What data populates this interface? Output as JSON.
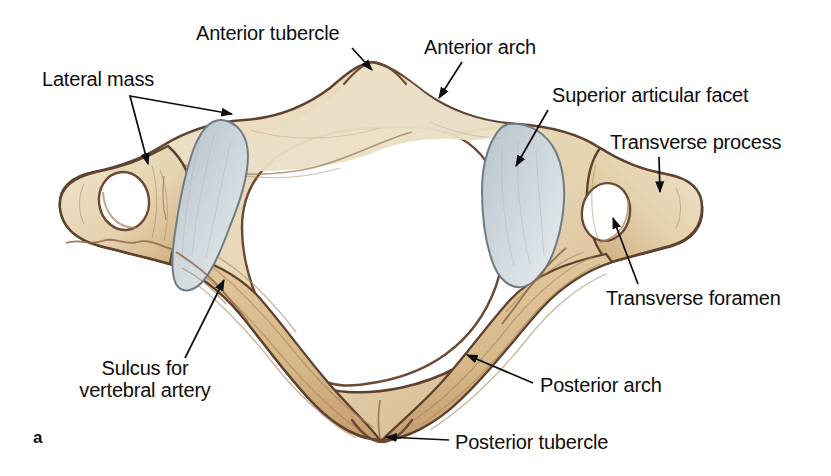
{
  "figure": {
    "panel_letter": "a",
    "background_color": "#ffffff"
  },
  "palette": {
    "bone_fill_light": "#ece0c8",
    "bone_fill_mid": "#ddc49a",
    "bone_fill_dark": "#c9a678",
    "bone_outline": "#5f4130",
    "bone_outline_soft": "#8a6646",
    "facet_fill": "#c2cbd2",
    "facet_fill_light": "#dfe6e9",
    "facet_outline": "#6f7b84",
    "label_text": "#100d0c",
    "leader_line": "#0d0d0d"
  },
  "labels": [
    {
      "id": "anterior-tubercle",
      "text": "Anterior tubercle",
      "x": 196,
      "y": 22,
      "align": "left",
      "leader": {
        "from": [
          352,
          48
        ],
        "to": [
          372,
          70
        ]
      }
    },
    {
      "id": "anterior-arch",
      "text": "Anterior arch",
      "x": 424,
      "y": 36,
      "align": "left",
      "leader": {
        "from": [
          462,
          62
        ],
        "to": [
          439,
          98
        ]
      }
    },
    {
      "id": "lateral-mass",
      "text": "Lateral mass",
      "x": 42,
      "y": 68,
      "align": "left",
      "leader_fork": {
        "vertex": [
          130,
          96
        ],
        "tips": [
          [
            232,
            114
          ],
          [
            148,
            164
          ]
        ]
      }
    },
    {
      "id": "superior-articular-facet",
      "text": "Superior articular facet",
      "x": 552,
      "y": 84,
      "align": "left",
      "leader": {
        "from": [
          548,
          110
        ],
        "to": [
          516,
          166
        ]
      }
    },
    {
      "id": "transverse-process",
      "text": "Transverse process",
      "x": 610,
      "y": 131,
      "align": "left",
      "leader": {
        "from": [
          659,
          157
        ],
        "to": [
          660,
          192
        ]
      }
    },
    {
      "id": "transverse-foramen",
      "text": "Transverse foramen",
      "x": 606,
      "y": 287,
      "align": "left",
      "leader": {
        "from": [
          638,
          284
        ],
        "to": [
          613,
          218
        ]
      }
    },
    {
      "id": "sulcus-for-vertebral-artery",
      "text": "Sulcus for\nvertebral artery",
      "x": 145,
      "y": 357,
      "align": "center",
      "leader": {
        "from": [
          185,
          358
        ],
        "to": [
          224,
          280
        ]
      }
    },
    {
      "id": "posterior-arch",
      "text": "Posterior arch",
      "x": 540,
      "y": 374,
      "align": "left",
      "leader": {
        "from": [
          533,
          383
        ],
        "to": [
          467,
          355
        ]
      }
    },
    {
      "id": "posterior-tubercle",
      "text": "Posterior tubercle",
      "x": 455,
      "y": 431,
      "align": "left",
      "leader": {
        "from": [
          449,
          440
        ],
        "to": [
          386,
          437
        ]
      }
    }
  ],
  "structures": [
    {
      "id": "vertebral-foramen",
      "name": "Vertebral foramen (central opening)"
    },
    {
      "id": "left-superior-articular-facet",
      "name": "Left superior articular facet"
    },
    {
      "id": "right-superior-articular-facet",
      "name": "Right superior articular facet"
    },
    {
      "id": "left-transverse-foramen",
      "name": "Left transverse foramen"
    },
    {
      "id": "right-transverse-foramen",
      "name": "Right transverse foramen"
    }
  ]
}
